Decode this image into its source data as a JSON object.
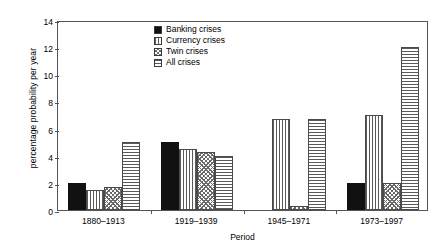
{
  "chart_data": {
    "type": "bar",
    "title": "",
    "xlabel": "Period",
    "ylabel": "percentage probability per year",
    "categories": [
      "1880–1913",
      "1919–1939",
      "1945–1971",
      "1973–1997"
    ],
    "series": [
      {
        "name": "Banking crises",
        "pattern": "solid",
        "values": [
          2.0,
          5.0,
          0.0,
          2.0
        ]
      },
      {
        "name": "Currency crises",
        "pattern": "vertical-lines",
        "values": [
          1.5,
          4.5,
          6.7,
          7.0
        ]
      },
      {
        "name": "Twin crises",
        "pattern": "diagonal-crosshatch",
        "values": [
          1.7,
          4.3,
          0.3,
          2.0
        ]
      },
      {
        "name": "All crises",
        "pattern": "horizontal-lines",
        "values": [
          5.0,
          4.0,
          6.7,
          12.0
        ]
      }
    ],
    "ylim": [
      0,
      14
    ],
    "yticks": [
      0,
      2,
      4,
      6,
      8,
      10,
      12,
      14
    ],
    "grid": false,
    "legend_position": "top-center"
  },
  "legend": {
    "entries": [
      {
        "label": "Banking crises"
      },
      {
        "label": "Currency crises"
      },
      {
        "label": "Twin crises"
      },
      {
        "label": "All crises"
      }
    ]
  }
}
